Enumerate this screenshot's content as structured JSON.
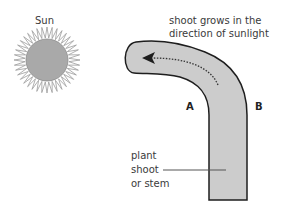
{
  "diagram": {
    "labels": {
      "sun": "Sun",
      "growth_line1": "shoot grows in the",
      "growth_line2": "direction of sunlight",
      "side_a": "A",
      "side_b": "B",
      "stem_line1": "plant",
      "stem_line2": "shoot",
      "stem_line3": "or stem"
    },
    "icons": {
      "sun": "sun-icon",
      "arrow": "dotted-arrow-icon"
    },
    "colors": {
      "sun_fill": "#a9a9a9",
      "sun_rays": "#9a9a9a",
      "shoot_fill": "#cccccc",
      "outline": "#1e1e1e",
      "text": "#3a3a3a"
    }
  }
}
